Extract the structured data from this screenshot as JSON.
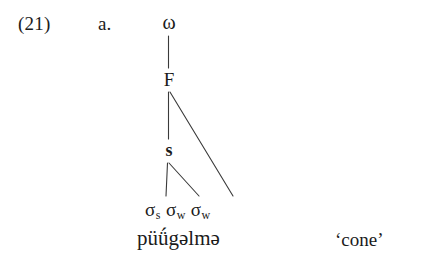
{
  "example": {
    "number": "(21)",
    "letter": "a."
  },
  "tree": {
    "nodes": {
      "prosodic_word": "ω",
      "foot": "F",
      "strong_branch": "s"
    },
    "terminals": [
      {
        "symbol": "σ",
        "subscript": "s"
      },
      {
        "symbol": "σ",
        "subscript": "w"
      },
      {
        "symbol": "σ",
        "subscript": "w"
      }
    ]
  },
  "form": {
    "transcription": "püǘgəlmə",
    "gloss": "‘cone’"
  },
  "style": {
    "line_color": "#3a3a3a",
    "text_color": "#1b1b1b",
    "background": "#ffffff"
  }
}
